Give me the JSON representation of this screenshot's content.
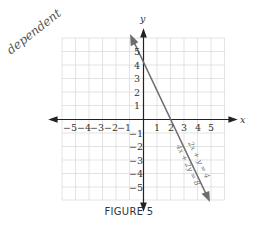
{
  "figure": {
    "caption": "FIGURE 5",
    "annotation": "dependent",
    "axis_labels": {
      "x": "x",
      "y": "y"
    },
    "x_ticks": [
      "-5",
      "-4",
      "-3",
      "-2",
      "-1",
      "1",
      "2",
      "3",
      "4",
      "5"
    ],
    "y_ticks": [
      "5",
      "4",
      "3",
      "2",
      "1",
      "-1",
      "-2",
      "-3",
      "-4",
      "-5"
    ],
    "equations": [
      "2x + y = 4",
      "4x + 2y = 8"
    ],
    "colors": {
      "line": "#6e6e6e",
      "grid": "#dcdcdc",
      "axis": "#222222"
    }
  }
}
